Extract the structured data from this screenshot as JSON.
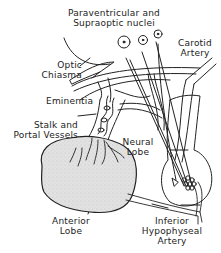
{
  "diagram": {
    "type": "anatomical illustration",
    "labels": {
      "nuclei_line1": "Paraventricular and",
      "nuclei_line2": "Supraoptic nuclei",
      "carotid_line1": "Carotid",
      "carotid_line2": "Artery",
      "chiasma_line1": "Optic",
      "chiasma_line2": "Chiasma",
      "eminentia": "Eminentia",
      "stalk_line1": "Stalk and",
      "stalk_line2": "Portal Vessels",
      "neural_line1": "Neural",
      "neural_line2": "Lobe",
      "anterior_line1": "Anterior",
      "anterior_line2": "Lobe",
      "inferior_line1": "Inferior",
      "inferior_line2": "Hypophyseal",
      "inferior_line3": "Artery"
    },
    "colors": {
      "ink": "#222222",
      "anterior_fill": "#dcdcdc",
      "vessel_fill": "#ffffff"
    }
  }
}
